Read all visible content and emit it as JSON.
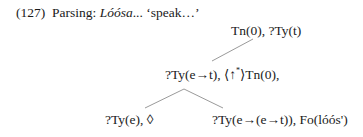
{
  "example": {
    "number": "(127)",
    "label": "Parsing:",
    "word": "Lóósa",
    "ellipsis": "...",
    "gloss": "‘speak…’"
  },
  "tree": {
    "root": {
      "text": "Tn(0), ?Ty(t)"
    },
    "middle": {
      "part1": "?Ty(e→t), ⟨↑",
      "sup": "*",
      "part2": "⟩Tn(0),"
    },
    "left_leaf": {
      "text": "?Ty(e), ◊"
    },
    "right_leaf": {
      "text": "?Ty(e→(e→t)), Fo(lóós')"
    }
  },
  "colors": {
    "text": "#1a1a1a",
    "lines": "#9a9a9a"
  }
}
